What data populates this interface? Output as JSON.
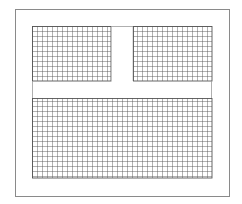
{
  "diagram": {
    "type": "grid-floor-plan",
    "outer_frame": {
      "x": 15,
      "y": 9,
      "width": 214,
      "height": 187,
      "stroke": "#8a8a8a"
    },
    "grid_area": {
      "x": 32,
      "y": 26,
      "width": 180,
      "height": 152
    },
    "cell_size": 5,
    "grid_stroke": "#555555",
    "blocks": [
      {
        "name": "upper-left",
        "x": 32,
        "y": 26,
        "width": 79,
        "height": 55
      },
      {
        "name": "upper-right",
        "x": 133,
        "y": 26,
        "width": 79,
        "height": 55
      },
      {
        "name": "bottom",
        "x": 32,
        "y": 98,
        "width": 180,
        "height": 80
      }
    ],
    "gap": {
      "vertical": {
        "x": 111,
        "y": 26,
        "width": 22,
        "height": 55
      },
      "horizontal": {
        "x": 32,
        "y": 81,
        "width": 180,
        "height": 17
      }
    }
  }
}
